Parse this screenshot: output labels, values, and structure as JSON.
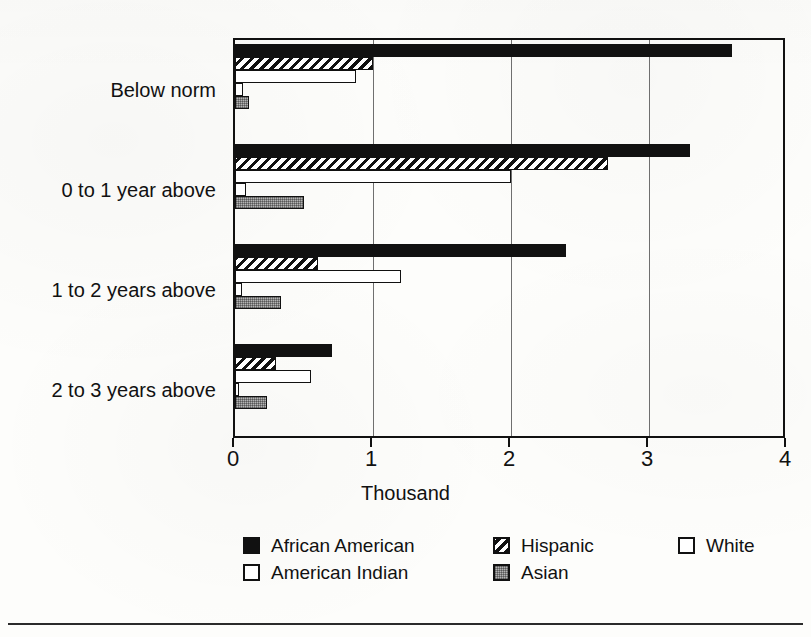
{
  "chart_data": {
    "type": "bar",
    "orientation": "horizontal",
    "title": "",
    "xlabel": "Thousand",
    "ylabel": "",
    "xlim": [
      0,
      4
    ],
    "xticks": [
      "0",
      "1",
      "2",
      "3",
      "4"
    ],
    "grid": true,
    "legend_position": "bottom",
    "categories": [
      "Below norm",
      "0 to 1 year above",
      "1 to 2 years above",
      "2 to 3 years above"
    ],
    "series": [
      {
        "name": "African American",
        "pattern": "solid-black",
        "values": [
          3.6,
          3.3,
          2.4,
          0.7
        ]
      },
      {
        "name": "Hispanic",
        "pattern": "diagonal-hatch",
        "values": [
          1.0,
          2.7,
          0.6,
          0.3
        ]
      },
      {
        "name": "White",
        "pattern": "white-outline",
        "values": [
          0.88,
          2.0,
          1.2,
          0.55
        ]
      },
      {
        "name": "American Indian",
        "pattern": "white-outline",
        "values": [
          0.06,
          0.08,
          0.05,
          0.03
        ]
      },
      {
        "name": "Asian",
        "pattern": "gray-dotted",
        "values": [
          0.1,
          0.5,
          0.33,
          0.23
        ]
      }
    ]
  },
  "axis": {
    "x_title": "Thousand",
    "tick_labels": [
      "0",
      "1",
      "2",
      "3",
      "4"
    ]
  },
  "y_labels": [
    "Below norm",
    "0 to 1 year above",
    "1 to 2 years above",
    "2 to 3 years above"
  ],
  "legend": {
    "row1": [
      {
        "label": "African American",
        "swatch": "solid-black"
      },
      {
        "label": "Hispanic",
        "swatch": "diagonal-hatch"
      },
      {
        "label": "White",
        "swatch": "white-outline"
      }
    ],
    "row2": [
      {
        "label": "American Indian",
        "swatch": "white-outline"
      },
      {
        "label": "Asian",
        "swatch": "gray-dotted"
      }
    ]
  },
  "colors": {
    "ink": "#111111",
    "gray_fill": "#b4b4b4",
    "white_fill": "#ffffff",
    "gridline": "#6f6f6f",
    "page": "#fdfdfb"
  }
}
